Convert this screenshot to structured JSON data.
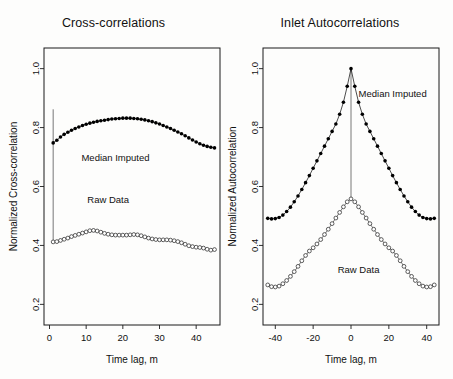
{
  "figure": {
    "background_color": "#fdfdfc",
    "foreground_color": "#111111"
  },
  "panels": {
    "left": {
      "title": "Cross-correlations",
      "xlabel": "Time lag, m",
      "ylabel": "Normalized Cross-correlation",
      "annotations": [
        {
          "text": "Median Imputed",
          "x": 18,
          "y": 0.685
        },
        {
          "text": "Raw Data",
          "x": 16,
          "y": 0.545
        }
      ]
    },
    "right": {
      "title": "Inlet Autocorrelations",
      "xlabel": "Time lag, m",
      "ylabel": "Normalized Autocorrelation",
      "annotations": [
        {
          "text": "Median Imputed",
          "x": 22,
          "y": 0.905
        },
        {
          "text": "Raw Data",
          "x": 4,
          "y": 0.305
        }
      ]
    }
  },
  "chart_data": [
    {
      "id": "cross-correlations",
      "type": "scatter",
      "title": "Cross-correlations",
      "xlabel": "Time lag, m",
      "ylabel": "Normalized Cross-correlation",
      "xlim": [
        -1.5,
        46.5
      ],
      "ylim": [
        0.13,
        1.07
      ],
      "xticks": [
        0,
        10,
        20,
        30,
        40
      ],
      "yticks": [
        0.2,
        0.4,
        0.6,
        0.8,
        1.0
      ],
      "grid": false,
      "legend": "in-plot annotations",
      "marker_note": "Median Imputed = filled circles; Raw Data = open circles; a vertical connector line joins the lag-1 open circle at 0.862 down to the Raw Data curve",
      "connector": {
        "x": 1,
        "y_top": 0.862,
        "y_bottom": 0.412
      },
      "series": [
        {
          "name": "Median Imputed",
          "marker": "filled-circle",
          "x": [
            1,
            2,
            3,
            4,
            5,
            6,
            7,
            8,
            9,
            10,
            11,
            12,
            13,
            14,
            15,
            16,
            17,
            18,
            19,
            20,
            21,
            22,
            23,
            24,
            25,
            26,
            27,
            28,
            29,
            30,
            31,
            32,
            33,
            34,
            35,
            36,
            37,
            38,
            39,
            40,
            41,
            42,
            43,
            44,
            45
          ],
          "values": [
            0.748,
            0.757,
            0.768,
            0.777,
            0.784,
            0.791,
            0.797,
            0.802,
            0.807,
            0.811,
            0.815,
            0.818,
            0.821,
            0.823,
            0.825,
            0.827,
            0.829,
            0.83,
            0.831,
            0.832,
            0.832,
            0.832,
            0.831,
            0.83,
            0.828,
            0.826,
            0.823,
            0.82,
            0.816,
            0.812,
            0.807,
            0.802,
            0.797,
            0.791,
            0.785,
            0.779,
            0.772,
            0.765,
            0.758,
            0.751,
            0.745,
            0.74,
            0.736,
            0.733,
            0.731
          ]
        },
        {
          "name": "Raw Data",
          "marker": "open-circle",
          "x": [
            1,
            2,
            3,
            4,
            5,
            6,
            7,
            8,
            9,
            10,
            11,
            12,
            13,
            14,
            15,
            16,
            17,
            18,
            19,
            20,
            21,
            22,
            23,
            24,
            25,
            26,
            27,
            28,
            29,
            30,
            31,
            32,
            33,
            34,
            35,
            36,
            37,
            38,
            39,
            40,
            41,
            42,
            43,
            44,
            45
          ],
          "values": [
            0.412,
            0.413,
            0.417,
            0.421,
            0.425,
            0.43,
            0.434,
            0.438,
            0.442,
            0.446,
            0.45,
            0.451,
            0.449,
            0.445,
            0.441,
            0.438,
            0.436,
            0.435,
            0.435,
            0.435,
            0.435,
            0.436,
            0.437,
            0.436,
            0.433,
            0.429,
            0.425,
            0.422,
            0.42,
            0.419,
            0.419,
            0.419,
            0.418,
            0.416,
            0.413,
            0.409,
            0.404,
            0.399,
            0.396,
            0.394,
            0.393,
            0.391,
            0.387,
            0.384,
            0.386
          ]
        }
      ]
    },
    {
      "id": "inlet-autocorrelations",
      "type": "scatter",
      "title": "Inlet Autocorrelations",
      "xlabel": "Time lag, m",
      "ylabel": "Normalized Autocorrelation",
      "xlim": [
        -46.5,
        46.5
      ],
      "ylim": [
        0.13,
        1.07
      ],
      "xticks": [
        -40,
        -20,
        0,
        20,
        40
      ],
      "yticks": [
        0.2,
        0.4,
        0.6,
        0.8,
        1.0
      ],
      "grid": false,
      "legend": "in-plot annotations",
      "marker_note": "Median Imputed = filled circles peaking at 1.0 and flattening near 0.49 at the edges; Raw Data = open circles peaking at 0.56 and flattening near 0.26 at the edges; a thin vertical line is drawn at lag 0",
      "connector": {
        "x": 0,
        "y_top": 1.0,
        "y_bottom": 0.555
      },
      "series": [
        {
          "name": "Median Imputed",
          "marker": "filled-circle",
          "x": [
            -44,
            -42,
            -40,
            -38,
            -36,
            -34,
            -32,
            -30,
            -28,
            -26,
            -24,
            -22,
            -20,
            -18,
            -16,
            -14,
            -12,
            -10,
            -8,
            -6,
            -4,
            -2,
            0,
            2,
            4,
            6,
            8,
            10,
            12,
            14,
            16,
            18,
            20,
            22,
            24,
            26,
            28,
            30,
            32,
            34,
            36,
            38,
            40,
            42,
            44
          ],
          "values": [
            0.492,
            0.49,
            0.491,
            0.495,
            0.503,
            0.515,
            0.53,
            0.548,
            0.568,
            0.59,
            0.613,
            0.637,
            0.662,
            0.687,
            0.712,
            0.737,
            0.762,
            0.787,
            0.812,
            0.845,
            0.886,
            0.94,
            1.0,
            0.94,
            0.886,
            0.845,
            0.812,
            0.787,
            0.762,
            0.737,
            0.712,
            0.687,
            0.662,
            0.637,
            0.613,
            0.59,
            0.568,
            0.548,
            0.53,
            0.515,
            0.503,
            0.495,
            0.491,
            0.49,
            0.492
          ]
        },
        {
          "name": "Raw Data",
          "marker": "open-circle",
          "x": [
            -44,
            -42,
            -40,
            -38,
            -36,
            -34,
            -32,
            -30,
            -28,
            -26,
            -24,
            -22,
            -20,
            -18,
            -16,
            -14,
            -12,
            -10,
            -8,
            -6,
            -4,
            -2,
            0,
            2,
            4,
            6,
            8,
            10,
            12,
            14,
            16,
            18,
            20,
            22,
            24,
            26,
            28,
            30,
            32,
            34,
            36,
            38,
            40,
            42,
            44
          ],
          "values": [
            0.266,
            0.26,
            0.259,
            0.262,
            0.27,
            0.281,
            0.295,
            0.311,
            0.329,
            0.348,
            0.366,
            0.381,
            0.392,
            0.405,
            0.42,
            0.437,
            0.455,
            0.474,
            0.493,
            0.512,
            0.531,
            0.548,
            0.558,
            0.548,
            0.531,
            0.512,
            0.493,
            0.474,
            0.455,
            0.437,
            0.42,
            0.405,
            0.392,
            0.381,
            0.366,
            0.348,
            0.329,
            0.311,
            0.295,
            0.281,
            0.27,
            0.262,
            0.259,
            0.26,
            0.266
          ]
        }
      ]
    }
  ]
}
